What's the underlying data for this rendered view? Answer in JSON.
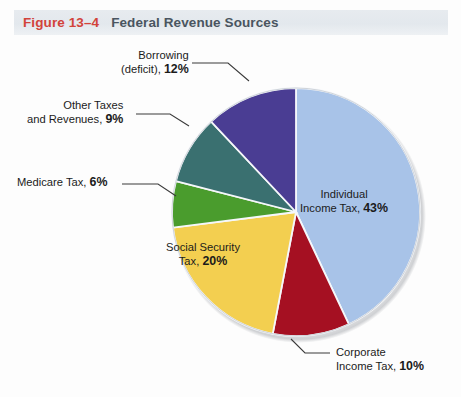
{
  "header": {
    "figure_number": "Figure 13–4",
    "title": "Federal Revenue Sources",
    "accent_red": "#d2433a",
    "title_color": "#4a5560",
    "band_color": "#e4e9ee"
  },
  "chart_data": {
    "type": "pie",
    "title": "Federal Revenue Sources",
    "xlabel": "",
    "ylabel": "",
    "start_angle_deg": 0,
    "direction": "clockwise",
    "legend": "none (direct labels)",
    "grid": false,
    "categories": [
      "Individual Income Tax",
      "Corporate Income Tax",
      "Social Security Tax",
      "Medicare Tax",
      "Other Taxes and Revenues",
      "Borrowing (deficit)"
    ],
    "values": [
      43,
      10,
      20,
      6,
      9,
      12
    ],
    "units": "percent",
    "colors": [
      "#a8c3e8",
      "#a51022",
      "#f3cf50",
      "#4a9c2d",
      "#3a7070",
      "#4a3d93"
    ],
    "slices": [
      {
        "name": "Individual Income Tax",
        "value": 43,
        "color": "#a8c3e8",
        "label_line1": "Individual",
        "label_line2": "Income Tax,",
        "label_pct": "43%",
        "label_placement": "inside"
      },
      {
        "name": "Corporate Income Tax",
        "value": 10,
        "color": "#a51022",
        "label_line1": "Corporate",
        "label_line2": "Income Tax,",
        "label_pct": "10%",
        "label_placement": "outside-leader"
      },
      {
        "name": "Social Security Tax",
        "value": 20,
        "color": "#f3cf50",
        "label_line1": "Social Security",
        "label_line2": "Tax,",
        "label_pct": "20%",
        "label_placement": "inside"
      },
      {
        "name": "Medicare Tax",
        "value": 6,
        "color": "#4a9c2d",
        "label_line1": "",
        "label_line2": "Medicare Tax,",
        "label_pct": "6%",
        "label_placement": "outside-leader"
      },
      {
        "name": "Other Taxes and Revenues",
        "value": 9,
        "color": "#3a7070",
        "label_line1": "Other Taxes",
        "label_line2": "and Revenues,",
        "label_pct": "9%",
        "label_placement": "outside-leader"
      },
      {
        "name": "Borrowing (deficit)",
        "value": 12,
        "color": "#4a3d93",
        "label_line1": "Borrowing",
        "label_line2": "(deficit),",
        "label_pct": "12%",
        "label_placement": "outside-leader"
      }
    ]
  }
}
